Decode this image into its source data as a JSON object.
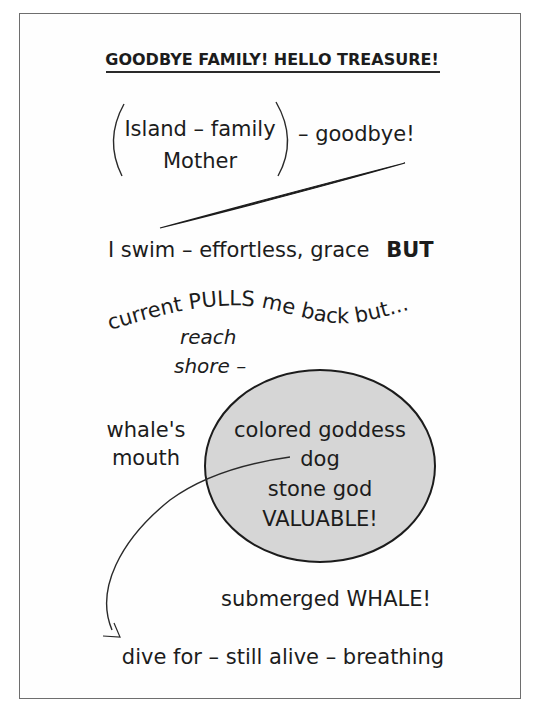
{
  "title": "GOODBYE FAMILY! HELLO TREASURE!",
  "bracket_group": {
    "line1": "Island – family",
    "line2": "Mother",
    "suffix": "– goodbye!"
  },
  "swim_line": {
    "text": "I swim – effortless, grace",
    "emphasis": "BUT"
  },
  "current_line": "current PULLS me back but...",
  "reach_line1": "reach",
  "reach_line2": "shore –",
  "whales_mouth": {
    "line1": "whale's",
    "line2": "mouth"
  },
  "treasure_circle": {
    "line1": "colored goddess",
    "line2": "dog",
    "line3": "stone god",
    "line4": "VALUABLE!",
    "fill_color": "#d6d6d6"
  },
  "submerged_line": "submerged WHALE!",
  "dive_line": "dive for – still alive – breathing",
  "colors": {
    "text": "#1c1c1c",
    "frame": "#6e6e6e",
    "background": "#ffffff"
  }
}
